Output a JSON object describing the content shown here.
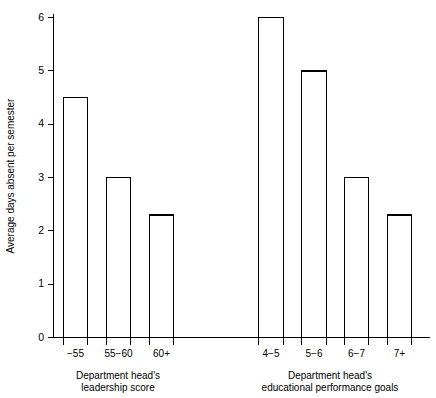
{
  "chart_data": {
    "type": "bar",
    "title": "",
    "subtitle": "",
    "xlabel": "",
    "ylabel": "Average days absent per semester",
    "ylim": [
      0,
      6
    ],
    "ytick_values": [
      0,
      1,
      2,
      3,
      4,
      5,
      6
    ],
    "ytick_labels": [
      "0",
      "1",
      "2",
      "3",
      "4",
      "5",
      "6"
    ],
    "grid": false,
    "legend": "none",
    "categories": [
      "−55",
      "55−60",
      "60+",
      "4−5",
      "5−6",
      "6−7",
      "7+"
    ],
    "values": [
      4.5,
      3.0,
      2.3,
      6.0,
      5.0,
      3.0,
      2.3
    ],
    "groups": [
      {
        "label_line1": "Department head's",
        "label_line2": "leadership score",
        "categories": [
          "−55",
          "55−60",
          "60+"
        ],
        "values": [
          4.5,
          3.0,
          2.3
        ]
      },
      {
        "label_line1": "Department head's",
        "label_line2": "educational performance goals",
        "categories": [
          "4−5",
          "5−6",
          "6−7",
          "7+"
        ],
        "values": [
          6.0,
          5.0,
          3.0,
          2.3
        ]
      }
    ],
    "bar_color": "#ffffff",
    "bar_edge_color": "#000000",
    "axis_color": "#000000",
    "background_color": "#ffffff"
  }
}
